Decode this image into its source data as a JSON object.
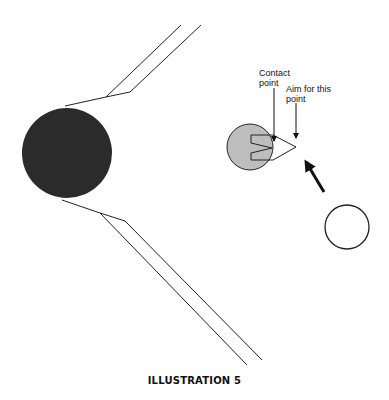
{
  "figure": {
    "caption": "ILLUSTRATION 5",
    "labels": {
      "contact_point": [
        "Contact",
        "point"
      ],
      "aim_point": [
        "Aim for this",
        "point"
      ]
    },
    "objects": {
      "corner_pocket_ball": {
        "fill": "#2b2b2b",
        "description": "dark ball at pocket"
      },
      "object_ball": {
        "fill": "#bdbdbd",
        "description": "object ball with ghost-ball aim marker"
      },
      "cue_ball": {
        "fill": "#ffffff",
        "description": "cue ball"
      },
      "direction_arrow": {
        "description": "cue ball travel direction"
      }
    }
  }
}
